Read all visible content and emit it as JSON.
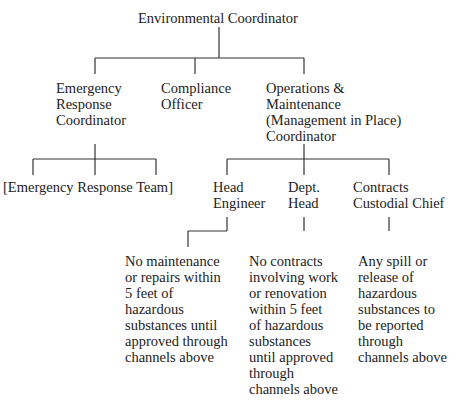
{
  "diagram": {
    "type": "org-chart",
    "root": {
      "label": "Environmental Coordinator"
    },
    "level1": [
      {
        "label": "Emergency\nResponse\nCoordinator"
      },
      {
        "label": "Compliance\nOfficer"
      },
      {
        "label": "Operations &\nMaintenance\n(Management in Place)\nCoordinator"
      }
    ],
    "emergency_team": {
      "label": "[Emergency Response Team]"
    },
    "level2": [
      {
        "label": "Head\nEngineer"
      },
      {
        "label": "Dept.\nHead"
      },
      {
        "label": "Contracts\nCustodial Chief"
      }
    ],
    "notes": [
      {
        "label": "No maintenance\nor repairs within\n5 feet of\nhazardous\nsubstances until\napproved through\nchannels above"
      },
      {
        "label": "No contracts\ninvolving work\nor renovation\nwithin 5 feet\nof hazardous\nsubstances\nuntil approved\nthrough\nchannels above"
      },
      {
        "label": "Any spill or\nrelease of\nhazardous\nsubstances to\nbe reported\nthrough\nchannels above"
      }
    ]
  }
}
